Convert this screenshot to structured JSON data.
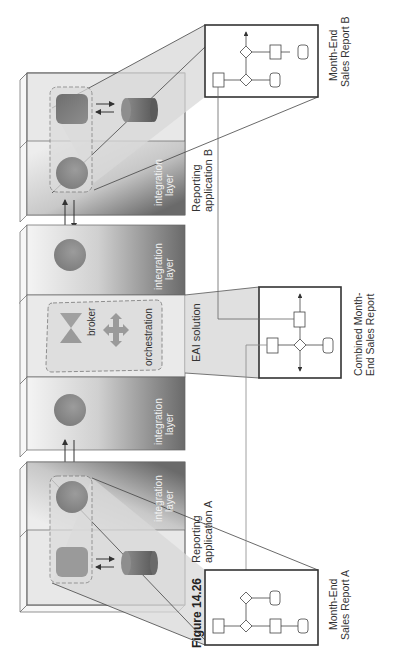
{
  "figure": {
    "caption": "Figure 14.26"
  },
  "applications": {
    "app_b": {
      "label_line1": "Reporting",
      "label_line2": "application B",
      "layer_line1": "integration",
      "layer_line2": "layer"
    },
    "app_a": {
      "label_line1": "Reporting",
      "label_line2": "application A",
      "layer_line1": "integration",
      "layer_line2": "layer"
    }
  },
  "integration_layers": {
    "upper": {
      "line1": "integration",
      "line2": "layer"
    },
    "lower": {
      "line1": "integration",
      "line2": "layer"
    }
  },
  "eai": {
    "label": "EAI solution",
    "broker_label": "broker",
    "orchestration_label": "orchestration"
  },
  "reports": {
    "report_b": {
      "line1": "Month-End",
      "line2": "Sales Report B"
    },
    "combined": {
      "line1": "Combined Month-",
      "line2": "End Sales Report"
    },
    "report_a": {
      "line1": "Month-End",
      "line2": "Sales Report A"
    }
  },
  "colors": {
    "slab_light": "#e6e6e6",
    "slab_dark": "#6a6a6a",
    "callout_fill": "#d9d9d9",
    "shape_dark": "#7a7a7a",
    "broker_fill": "#9a9a9a",
    "line": "#444444"
  }
}
